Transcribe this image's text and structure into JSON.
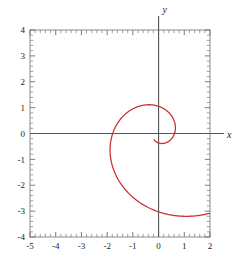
{
  "figure": {
    "title": "",
    "axis_labels": {
      "x": "x",
      "y": "y"
    }
  },
  "chart_data": {
    "type": "line",
    "title": "",
    "xlabel": "x",
    "ylabel": "y",
    "xlim": [
      -5,
      2
    ],
    "ylim": [
      -4,
      4
    ],
    "xticks": [
      -5,
      -4,
      -3,
      -2,
      -1,
      0,
      1,
      2
    ],
    "xticklabels": [
      "-5",
      "-4",
      "-3",
      "-2",
      "-1",
      "0",
      "1",
      "2"
    ],
    "yticks": [
      -4,
      -3,
      -2,
      -1,
      0,
      1,
      2,
      3,
      4
    ],
    "yticklabels": [
      "-4",
      "-3",
      "-2",
      "-1",
      "0",
      "1",
      "2",
      "3",
      "4"
    ],
    "minor_tick_count_per_unit": 5,
    "grid": false,
    "legend": null,
    "series": [
      {
        "name": "logarithmic spiral",
        "color": "#cc3333",
        "description": "Outward logarithmic spiral starting near the origin, looping counterclockwise through (1,0), (0,1), (-1.27,0), (0,-1) on the inner turn, then through (1.5,0), (0,3), (-4.58,0) and exiting the frame near (-3.6,-4).",
        "key_points": [
          {
            "x": 0.62,
            "y": 0.0
          },
          {
            "x": 0.0,
            "y": 1.0
          },
          {
            "x": -1.27,
            "y": 0.0
          },
          {
            "x": 0.0,
            "y": -1.0
          },
          {
            "x": 1.5,
            "y": 0.0
          },
          {
            "x": -0.9,
            "y": 3.03
          },
          {
            "x": -4.58,
            "y": 0.0
          },
          {
            "x": -3.6,
            "y": -4.0
          }
        ]
      }
    ]
  }
}
